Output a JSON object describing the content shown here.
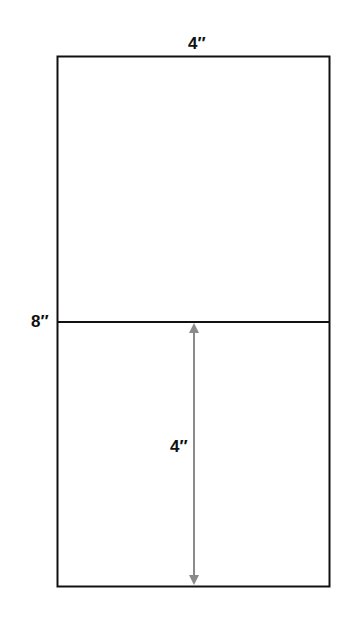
{
  "diagram": {
    "top_label": "4″",
    "left_label": "8″",
    "arrow_label": "4″",
    "colors": {
      "outline": "#111111",
      "arrow": "#8a8a8a",
      "background": "#ffffff"
    }
  }
}
